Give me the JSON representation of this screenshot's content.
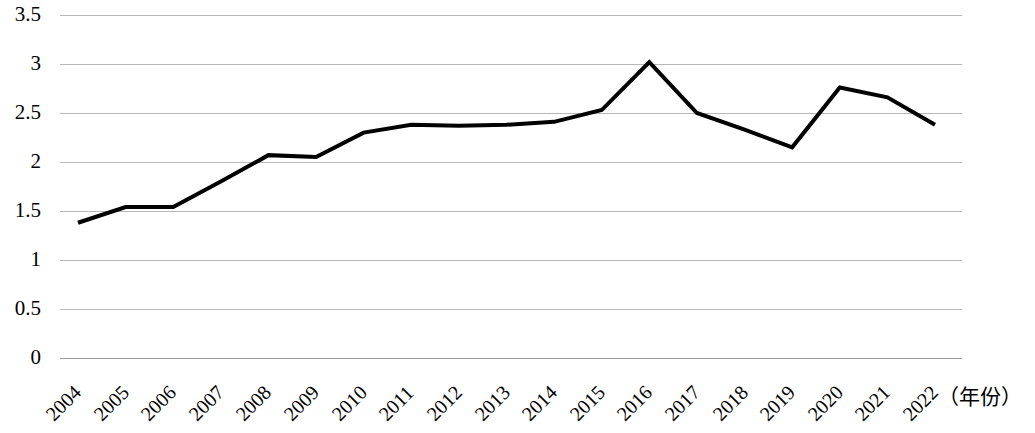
{
  "chart_data": {
    "type": "line",
    "title": "",
    "subtitle": "",
    "xlabel": "（年份）",
    "ylabel": "",
    "categories": [
      "2004",
      "2005",
      "2006",
      "2007",
      "2008",
      "2009",
      "2010",
      "2011",
      "2012",
      "2013",
      "2014",
      "2015",
      "2016",
      "2017",
      "2018",
      "2019",
      "2020",
      "2021",
      "2022"
    ],
    "values": [
      1.38,
      1.54,
      1.54,
      1.8,
      2.07,
      2.05,
      2.3,
      2.38,
      2.37,
      2.38,
      2.41,
      2.53,
      3.02,
      2.5,
      2.33,
      2.15,
      2.76,
      2.66,
      2.38
    ],
    "series": [
      {
        "name": "",
        "values": [
          1.38,
          1.54,
          1.54,
          1.8,
          2.07,
          2.05,
          2.3,
          2.38,
          2.37,
          2.38,
          2.41,
          2.53,
          3.02,
          2.5,
          2.33,
          2.15,
          2.76,
          2.66,
          2.38
        ]
      }
    ],
    "ylim": [
      0,
      3.5
    ],
    "yticks": [
      "0",
      "0.5",
      "1",
      "1.5",
      "2",
      "2.5",
      "3",
      "3.5"
    ],
    "ytick_values": [
      0,
      0.5,
      1,
      1.5,
      2,
      2.5,
      3,
      3.5
    ],
    "xticks": [
      "2004",
      "2005",
      "2006",
      "2007",
      "2008",
      "2009",
      "2010",
      "2011",
      "2012",
      "2013",
      "2014",
      "2015",
      "2016",
      "2017",
      "2018",
      "2019",
      "2020",
      "2021",
      "2022"
    ],
    "grid": true,
    "grid_axis": "y",
    "legend": false,
    "legend_position": "none",
    "line_color": "#000000",
    "grid_color": "#b7b7b7",
    "background_color": "#ffffff",
    "line_width": 4,
    "markers": false,
    "annotations": []
  }
}
